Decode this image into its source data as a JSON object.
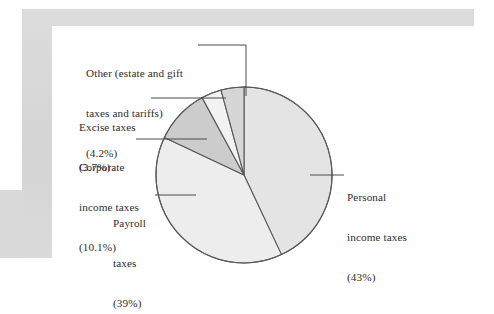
{
  "figure": {
    "kind": "pie-chart-figure",
    "background_color": "#ffffff",
    "frame_color": "#d8d8d8",
    "plate_color": "#ffffff"
  },
  "chart_data": {
    "type": "pie",
    "title": "",
    "subtitle": "",
    "xlabel": "",
    "ylabel": "",
    "legend_position": "callout-labels",
    "grid": false,
    "start_angle_deg": 0,
    "direction": "clockwise",
    "units": "percent",
    "categories": [
      "Personal income taxes",
      "Payroll taxes",
      "Corporate income taxes",
      "Excise taxes",
      "Other (estate and gift taxes and tariffs)"
    ],
    "values": [
      43,
      39,
      10.1,
      3.7,
      4.2
    ],
    "value_labels": [
      "(43%)",
      "(39%)",
      "(10.1%)",
      "(3.7%)",
      "(4.2%)"
    ],
    "slice_colors": [
      "#e4e4e4",
      "#ededed",
      "#cccccc",
      "#f2f2f2",
      "#d6d6d6"
    ],
    "stroke_color": "#5a5a5a"
  },
  "labels": {
    "other": {
      "line1": "Other (estate and gift",
      "line2": "taxes and tariffs)",
      "line3": "(4.2%)"
    },
    "excise": {
      "line1": "Excise taxes",
      "line2": "(3.7%)"
    },
    "corporate": {
      "line1": "Corporate",
      "line2": "income taxes",
      "line3": "(10.1%)"
    },
    "payroll": {
      "line1": "Payroll",
      "line2": "taxes",
      "line3": "(39%)"
    },
    "personal": {
      "line1": "Personal",
      "line2": "income taxes",
      "line3": "(43%)"
    }
  }
}
